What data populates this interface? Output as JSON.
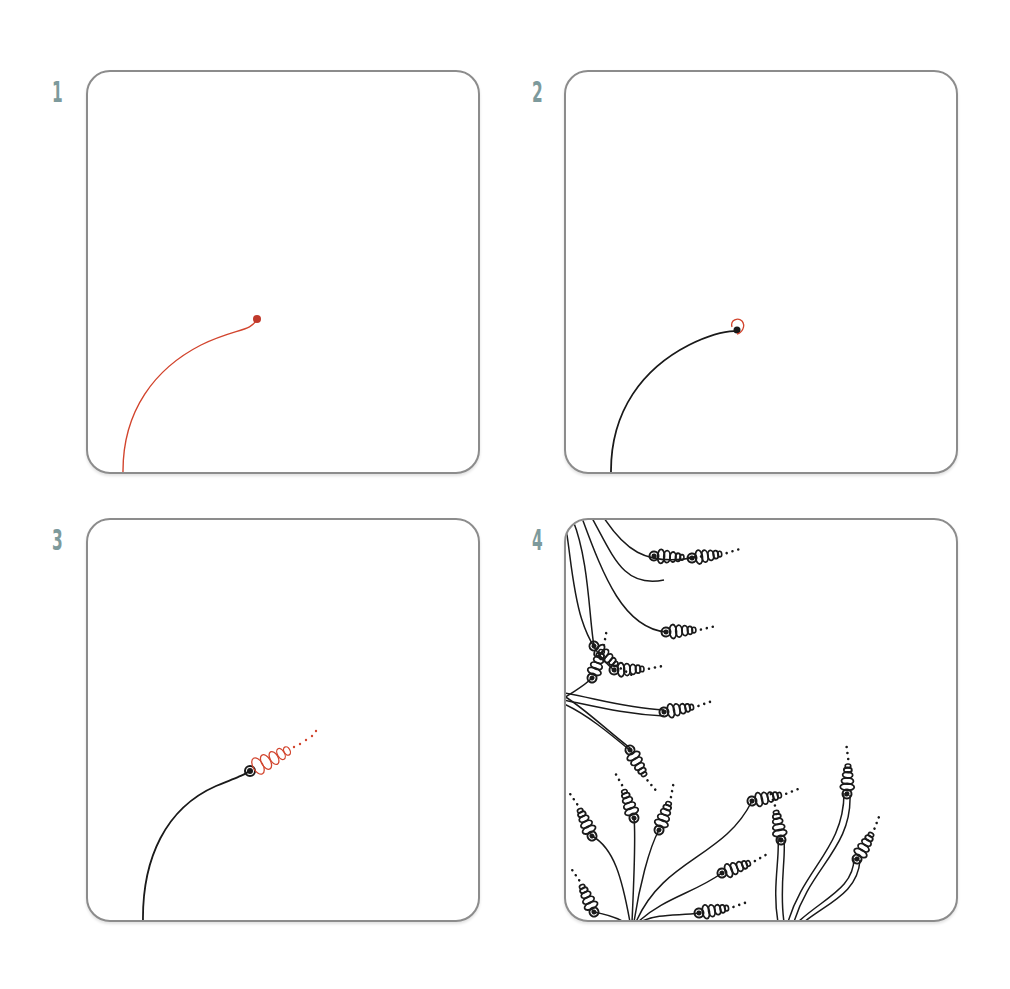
{
  "colors": {
    "step_number": "#7d9a9c",
    "new_stroke": "#d2452e",
    "ink": "#1a1a1a",
    "panel_border": "#8c8c8c"
  },
  "steps": [
    {
      "number": "1",
      "description": "Draw a curved stem ending in a dot (red = new stroke)"
    },
    {
      "number": "2",
      "description": "Stem inked; add a loop around the dot (red)"
    },
    {
      "number": "3",
      "description": "Add tapering stacked loops followed by dots (red)"
    },
    {
      "number": "4",
      "description": "Completed pattern of many stems with looped tips filling the tile"
    }
  ]
}
